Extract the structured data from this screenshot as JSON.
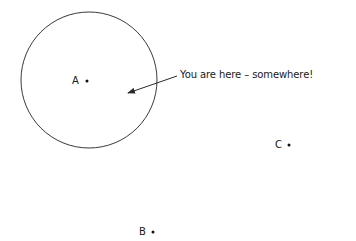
{
  "diagram": {
    "points": [
      {
        "label": "A",
        "x": 87,
        "y": 81
      },
      {
        "label": "B",
        "x": 153,
        "y": 232
      },
      {
        "label": "C",
        "x": 289,
        "y": 145
      }
    ],
    "circle": {
      "cx": 89,
      "cy": 80,
      "r": 68
    },
    "annotation": {
      "text": "You are here – somewhere!",
      "arrow_from": [
        177,
        76
      ],
      "arrow_to": [
        127,
        93
      ]
    },
    "colors": {
      "stroke": "#3a3a3a",
      "text": "#1a1a1a",
      "background": "#ffffff"
    }
  }
}
